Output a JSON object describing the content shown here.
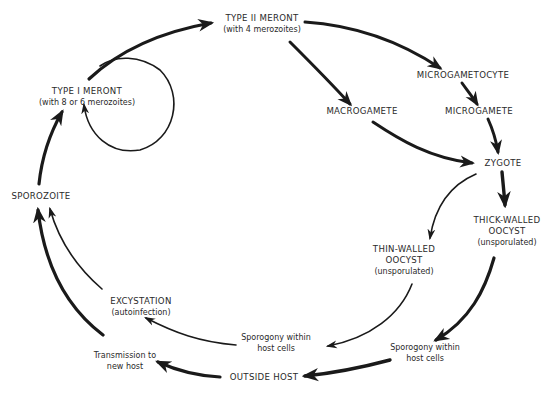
{
  "diagram": {
    "type": "life-cycle",
    "nodes": {
      "type2_meront": {
        "title": "TYPE II MERONT",
        "sub": "(with 4 merozoites)"
      },
      "type1_meront": {
        "title": "TYPE I MERONT",
        "sub": "(with 8 or 6 merozoites)"
      },
      "microgametocyte": {
        "title": "MICROGAMETOCYTE"
      },
      "macrogamete": {
        "title": "MACROGAMETE"
      },
      "microgamete": {
        "title": "MICROGAMETE"
      },
      "zygote": {
        "title": "ZYGOTE"
      },
      "sporozoite": {
        "title": "SPOROZOITE"
      },
      "thick_oocyst": {
        "line1": "THICK-WALLED",
        "line2": "OOCYST",
        "sub": "(unsporulated)"
      },
      "thin_oocyst": {
        "line1": "THIN-WALLED",
        "line2": "OOCYST",
        "sub": "(unsporulated)"
      },
      "excystation": {
        "title": "EXCYSTATION",
        "sub": "(autoinfection)"
      },
      "sporogony_inner": {
        "line1": "Sporogony within",
        "line2": "host cells"
      },
      "sporogony_outer": {
        "line1": "Sporogony within",
        "line2": "host cells"
      },
      "transmission": {
        "line1": "Transmission to",
        "line2": "new host"
      },
      "outside_host": {
        "title": "OUTSIDE HOST"
      }
    },
    "edges": [
      {
        "from": "TYPE I MERONT",
        "to": "TYPE II MERONT"
      },
      {
        "from": "TYPE I MERONT",
        "to": "TYPE I MERONT",
        "kind": "self-loop"
      },
      {
        "from": "TYPE II MERONT",
        "to": "MICROGAMETOCYTE"
      },
      {
        "from": "TYPE II MERONT",
        "to": "MACROGAMETE"
      },
      {
        "from": "MICROGAMETOCYTE",
        "to": "MICROGAMETE"
      },
      {
        "from": "MICROGAMETE",
        "to": "ZYGOTE"
      },
      {
        "from": "MACROGAMETE",
        "to": "ZYGOTE"
      },
      {
        "from": "ZYGOTE",
        "to": "THICK-WALLED OOCYST"
      },
      {
        "from": "ZYGOTE",
        "to": "THIN-WALLED OOCYST"
      },
      {
        "from": "THIN-WALLED OOCYST",
        "to": "Sporogony within host cells (inner)"
      },
      {
        "from": "THICK-WALLED OOCYST",
        "to": "Sporogony within host cells (outer)"
      },
      {
        "from": "Sporogony within host cells (inner)",
        "to": "EXCYSTATION"
      },
      {
        "from": "Sporogony within host cells (outer)",
        "to": "OUTSIDE HOST"
      },
      {
        "from": "OUTSIDE HOST",
        "to": "Transmission to new host"
      },
      {
        "from": "EXCYSTATION",
        "to": "SPOROZOITE"
      },
      {
        "from": "Transmission to new host",
        "to": "SPOROZOITE"
      },
      {
        "from": "SPOROZOITE",
        "to": "TYPE I MERONT"
      }
    ]
  }
}
